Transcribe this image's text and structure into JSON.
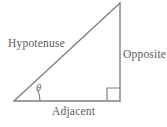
{
  "figure": {
    "kind": "right-triangle-trigonometry-diagram",
    "background_color": "#ffffff",
    "line_color": "#808080",
    "text_color": "#5d5d5d",
    "labels": {
      "hypotenuse": "Hypotenuse",
      "opposite": "Opposite",
      "adjacent": "Adjacent",
      "angle": "θ"
    },
    "geometry": {
      "vertices": {
        "left": [
          14,
          101
        ],
        "bottom_right": [
          120,
          101
        ],
        "apex": [
          120,
          3
        ]
      },
      "right_angle_marker": {
        "x": 107,
        "y": 88,
        "size": 13
      },
      "angle_arc_radius": 26
    }
  }
}
